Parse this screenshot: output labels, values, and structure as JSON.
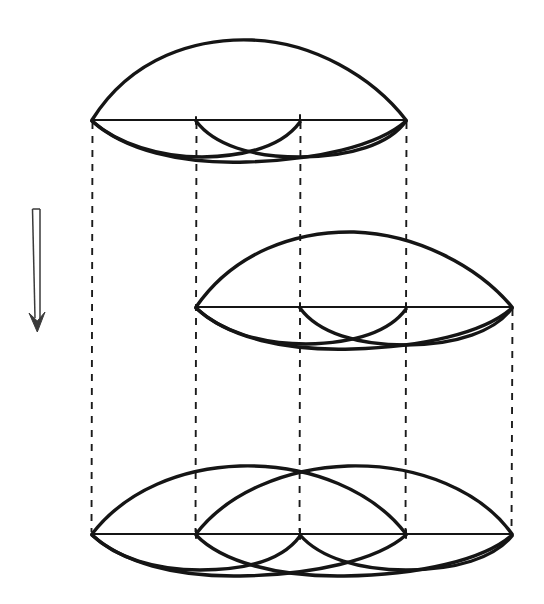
{
  "figure": {
    "caption": "",
    "background_color": "#ffffff",
    "ink_color": "#151515",
    "dash_color": "#1b1b1b",
    "arrow_color": "#3a3a3a",
    "canvas": {
      "width": 544,
      "height": 604
    }
  },
  "chart_data": {
    "type": "diagram",
    "xlabel": "",
    "ylabel": "",
    "grid": false,
    "legend": "none",
    "xlim": [
      0,
      544
    ],
    "ylim": [
      0,
      604
    ],
    "node_x_positions": [
      92,
      196,
      300,
      406,
      512
    ],
    "panels": [
      {
        "name": "top-lens",
        "axis_y": 120,
        "x_start": 92,
        "x_end": 406,
        "upper_arc_apex_y": 43,
        "lower_arc_nadir_y": 161,
        "inner_lower_arcs": [
          [
            92,
            300
          ],
          [
            196,
            406
          ]
        ],
        "inner_lower_nadir_y": 156,
        "vertex_count": 2,
        "lobe_count": 2
      },
      {
        "name": "middle-lens",
        "axis_y": 307,
        "x_start": 196,
        "x_end": 512,
        "upper_arc_apex_y": 238,
        "lower_arc_nadir_y": 348,
        "inner_lower_arcs": [
          [
            196,
            406
          ],
          [
            300,
            512
          ]
        ],
        "inner_lower_nadir_y": 343,
        "vertex_count": 2,
        "lobe_count": 2
      },
      {
        "name": "bottom-lens",
        "axis_y": 534,
        "x_start": 92,
        "x_end": 512,
        "upper_arcs": [
          [
            92,
            406
          ],
          [
            196,
            512
          ]
        ],
        "upper_arc_apex_y": 464,
        "lower_arc_nadir_y": 576,
        "inner_lower_arcs": [
          [
            92,
            300
          ],
          [
            196,
            406
          ],
          [
            300,
            512
          ]
        ],
        "inner_lower_nadir_y": 570,
        "vertex_count": 2,
        "lobe_count": 3
      }
    ],
    "projectors": [
      {
        "x": 92,
        "y_start": 120,
        "y_end": 534
      },
      {
        "x": 196,
        "y_start": 120,
        "y_end": 534
      },
      {
        "x": 300,
        "y_start": 120,
        "y_end": 534
      },
      {
        "x": 406,
        "y_start": 120,
        "y_end": 534
      },
      {
        "x": 512,
        "y_start": 307,
        "y_end": 534
      }
    ],
    "arrow": {
      "name": "downward-double-arrow",
      "x_left": 32,
      "x_right": 40,
      "y_top": 208,
      "y_tip": 332,
      "direction": "down",
      "style": "double-line outline"
    }
  }
}
